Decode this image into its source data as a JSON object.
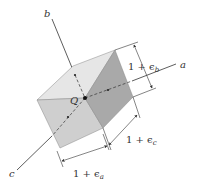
{
  "diagram": {
    "origin_label": "Q",
    "axes": [
      {
        "id": "a",
        "label": "a"
      },
      {
        "id": "b",
        "label": "b"
      },
      {
        "id": "c",
        "label": "c"
      }
    ],
    "dimensions": {
      "a": {
        "prefix": "1 + ",
        "symbol": "ϵ",
        "sub": "a"
      },
      "b": {
        "prefix": "1 + ",
        "symbol": "ϵ",
        "sub": "b"
      },
      "c": {
        "prefix": "1 + ",
        "symbol": "ϵ",
        "sub": "c"
      }
    },
    "colors": {
      "face_top": "#e6e6e6",
      "face_front": "#cfcfcf",
      "face_right": "#a9a9a9",
      "line": "#333333"
    }
  }
}
